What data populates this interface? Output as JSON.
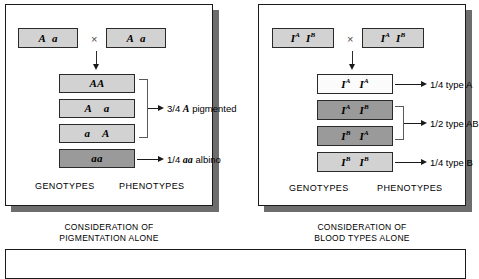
{
  "figure": {
    "panels": [
      {
        "id": "pigmentation",
        "caption_line1": "CONSIDERATION OF",
        "caption_line2": "PIGMENTATION ALONE",
        "cross_symbol": "×",
        "column_headers": {
          "genotypes": "GENOTYPES",
          "phenotypes": "PHENOTYPES"
        },
        "parents": [
          {
            "name": "parent-left",
            "allele1": "A",
            "allele2": "a",
            "sup1": "",
            "sup2": ""
          },
          {
            "name": "parent-right",
            "allele1": "A",
            "allele2": "a",
            "sup1": "",
            "sup2": ""
          }
        ],
        "offspring": [
          {
            "name": "offspring-AA",
            "allele1": "A",
            "allele2": "A",
            "sup1": "",
            "sup2": "",
            "shade": "light",
            "joined": true
          },
          {
            "name": "offspring-Aa",
            "allele1": "A",
            "allele2": "a",
            "sup1": "",
            "sup2": "",
            "shade": "light",
            "joined": true
          },
          {
            "name": "offspring-aA",
            "allele1": "a",
            "allele2": "A",
            "sup1": "",
            "sup2": "",
            "shade": "light",
            "joined": true
          },
          {
            "name": "offspring-aa",
            "allele1": "a",
            "allele2": "a",
            "sup1": "",
            "sup2": "",
            "shade": "dark",
            "joined": false
          }
        ],
        "phenotypes": [
          {
            "name": "phenotype-pigmented",
            "fraction": "3/4",
            "symbol": "A",
            "text": "pigmented"
          },
          {
            "name": "phenotype-albino",
            "fraction": "1/4",
            "symbol": "aa",
            "text": "albino"
          }
        ]
      },
      {
        "id": "blood-types",
        "caption_line1": "CONSIDERATION OF",
        "caption_line2": "BLOOD TYPES ALONE",
        "cross_symbol": "×",
        "column_headers": {
          "genotypes": "GENOTYPES",
          "phenotypes": "PHENOTYPES"
        },
        "parents": [
          {
            "name": "parent-left",
            "allele1": "I",
            "allele2": "I",
            "sup1": "A",
            "sup2": "B"
          },
          {
            "name": "parent-right",
            "allele1": "I",
            "allele2": "I",
            "sup1": "A",
            "sup2": "B"
          }
        ],
        "offspring": [
          {
            "name": "offspring-IAIA",
            "allele1": "I",
            "allele2": "I",
            "sup1": "A",
            "sup2": "A",
            "shade": "white",
            "joined": false
          },
          {
            "name": "offspring-IAIB",
            "allele1": "I",
            "allele2": "I",
            "sup1": "A",
            "sup2": "B",
            "shade": "dark",
            "joined": true
          },
          {
            "name": "offspring-IBIA",
            "allele1": "I",
            "allele2": "I",
            "sup1": "B",
            "sup2": "A",
            "shade": "dark",
            "joined": true
          },
          {
            "name": "offspring-IBIB",
            "allele1": "I",
            "allele2": "I",
            "sup1": "B",
            "sup2": "B",
            "shade": "light",
            "joined": false
          }
        ],
        "phenotypes": [
          {
            "name": "phenotype-type-a",
            "fraction": "1/4",
            "symbol": "",
            "text": "type A"
          },
          {
            "name": "phenotype-type-ab",
            "fraction": "1/2",
            "symbol": "",
            "text": "type AB"
          },
          {
            "name": "phenotype-type-b",
            "fraction": "1/4",
            "symbol": "",
            "text": "type B"
          }
        ]
      }
    ],
    "colors": {
      "box_light": "#d2d2d2",
      "box_dark": "#9a9a9a",
      "box_white": "#fbfbfb",
      "border": "#1a1a1a",
      "shadow": "#6d6d6d"
    }
  }
}
